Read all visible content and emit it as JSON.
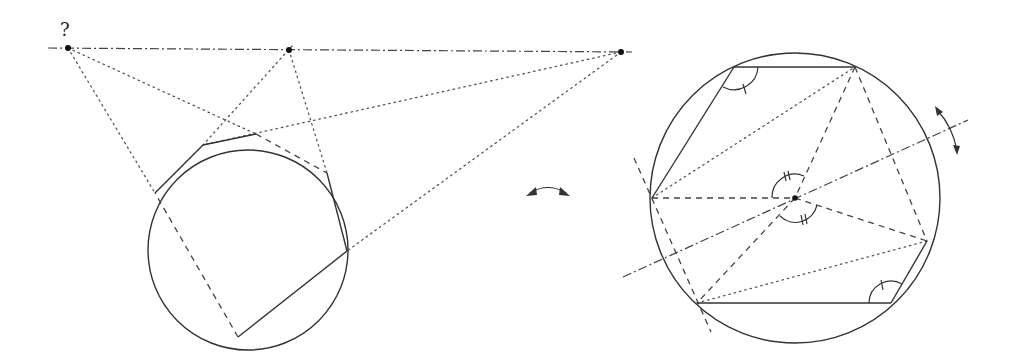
{
  "figure": {
    "left": {
      "question_label": "?",
      "circle": {
        "cx": 248,
        "cy": 250,
        "r": 100
      },
      "vertices": {
        "A": [
          155,
          193
        ],
        "B": [
          203,
          145
        ],
        "C": [
          256,
          134
        ],
        "D": [
          327,
          173
        ],
        "E": [
          347,
          251
        ],
        "F": [
          238,
          337
        ]
      },
      "pascal_points": {
        "P1": [
          68,
          48
        ],
        "P2": [
          289,
          50
        ],
        "P3": [
          621,
          52
        ]
      },
      "solid_sides": [
        "A-B",
        "B-C",
        "D-E",
        "E-F"
      ],
      "dashed_sides": [
        "C-D",
        "F-A"
      ]
    },
    "middle": {
      "symbol": "double-headed-curved-arrow"
    },
    "right": {
      "circle": {
        "cx": 795,
        "cy": 198,
        "r": 145
      },
      "center": [
        795,
        198
      ],
      "vertices": {
        "T1": [
          734,
          67
        ],
        "T2": [
          855,
          67
        ],
        "L": [
          652,
          198
        ],
        "R": [
          927,
          241
        ],
        "B1": [
          697,
          303
        ],
        "B2": [
          891,
          303
        ]
      },
      "angle_marks": [
        "T1 (single tick)",
        "B2 (single tick)",
        "center upper (double tick)",
        "center lower (double tick)"
      ],
      "symmetry_axis": "dash-dot line through center",
      "rotation_arrow": "double-headed curved arrow on the axis"
    }
  }
}
